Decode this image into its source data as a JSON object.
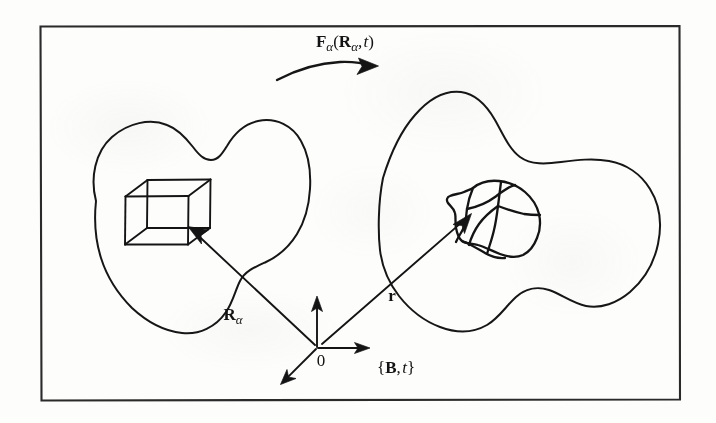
{
  "figure": {
    "kind": "hand-drawn-diagram",
    "background_color": "#fdfdfc",
    "ink_color": "#141414",
    "frame": {
      "name": "figure-border",
      "x": 40,
      "y": 26,
      "width": 639,
      "height": 373
    },
    "labels": {
      "deformation_map": {
        "text": "Fα(Rα, t)",
        "bold_parts": [
          "F",
          "R"
        ],
        "subscript": "α",
        "italic_parts": [
          "t"
        ],
        "x": 345,
        "y": 47
      },
      "reference_position_vector": {
        "text": "Rα",
        "bold_parts": [
          "R"
        ],
        "subscript": "α",
        "x": 233,
        "y": 320
      },
      "current_position_vector": {
        "text": "r",
        "bold_parts": [
          "r"
        ],
        "x": 392,
        "y": 301
      },
      "origin": {
        "text": "0",
        "x": 321,
        "y": 366
      },
      "configuration": {
        "text": "{B, t}",
        "bold_parts": [
          "B"
        ],
        "italic_parts": [
          "t"
        ],
        "x": 377,
        "y": 373
      }
    },
    "shapes": {
      "reference_body": {
        "name": "reference-configuration-blob",
        "description": "closed smooth lobed outline, left side"
      },
      "current_body": {
        "name": "current-configuration-blob",
        "description": "closed wavy outline, right side"
      },
      "reference_element": {
        "name": "undeformed-cube",
        "description": "wireframe cube, 12 visible edges"
      },
      "current_element": {
        "name": "deformed-cube",
        "description": "warped curvilinear hexahedron with curved internal edges"
      }
    },
    "vectors": {
      "R_alpha": {
        "from": [
          315,
          345
        ],
        "to": [
          190,
          228
        ]
      },
      "r": {
        "from": [
          322,
          344
        ],
        "to": [
          470,
          215
        ]
      },
      "axis_up": {
        "from": [
          317,
          347
        ],
        "to": [
          317,
          297
        ]
      },
      "axis_right": {
        "from": [
          318,
          348
        ],
        "to": [
          369,
          348
        ]
      },
      "axis_down_left": {
        "from": [
          316,
          349
        ],
        "to": [
          281,
          384
        ]
      },
      "deformation_arc": {
        "from": [
          277,
          80
        ],
        "to": [
          374,
          67
        ]
      }
    }
  }
}
